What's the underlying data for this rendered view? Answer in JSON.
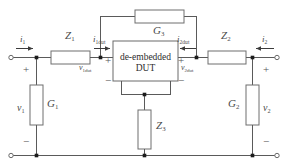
{
  "diagram": {
    "dut": {
      "line1": "de-embedded",
      "line2": "DUT"
    },
    "components": {
      "z1": "Z",
      "z1_sub": "1",
      "z2": "Z",
      "z2_sub": "2",
      "z3": "Z",
      "z3_sub": "3",
      "g1": "G",
      "g1_sub": "1",
      "g2": "G",
      "g2_sub": "2",
      "g3": "G",
      "g3_sub": "3"
    },
    "currents": {
      "i1": "i",
      "i1_sub": "1",
      "i2": "i",
      "i2_sub": "2",
      "i1dut": "i",
      "i1dut_sub": "1dut",
      "i2dut": "i",
      "i2dut_sub": "2dut"
    },
    "voltages": {
      "v1": "v",
      "v1_sub": "1",
      "v2": "v",
      "v2_sub": "2",
      "v1dut": "v",
      "v1dut_sub": "1dut",
      "v2dut": "v",
      "v2dut_sub": "2dut"
    },
    "polarity": {
      "plus": "+",
      "minus": "−"
    },
    "colors": {
      "wire": "#5a5a5a",
      "component_outline": "#6e6e6e",
      "node": "#1c1c1c",
      "label_text": "#4a4a4a",
      "dut_text": "#2e2e2e",
      "background": "#ffffff"
    }
  }
}
